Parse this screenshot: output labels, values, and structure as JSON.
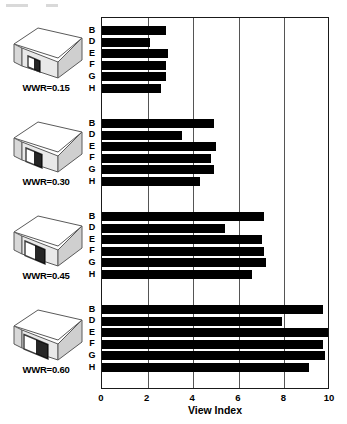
{
  "chart_data": {
    "type": "bar",
    "orientation": "horizontal",
    "title": "",
    "xlabel": "View Index",
    "ylabel": "",
    "xlim": [
      0,
      10
    ],
    "xticks": [
      0,
      2,
      4,
      6,
      8,
      10
    ],
    "xtick_labels": [
      "0",
      "2",
      "4",
      "6",
      "8",
      "10"
    ],
    "grid": "vertical gridlines at each x tick",
    "legend": "none",
    "categories": [
      "B",
      "D",
      "E",
      "F",
      "G",
      "H"
    ],
    "groups": [
      {
        "name": "WWR=0.15",
        "label": "WWR=0.15",
        "values": [
          2.8,
          2.1,
          2.9,
          2.8,
          2.8,
          2.6
        ]
      },
      {
        "name": "WWR=0.30",
        "label": "WWR=0.30",
        "values": [
          4.9,
          3.5,
          5.0,
          4.8,
          4.9,
          4.3
        ]
      },
      {
        "name": "WWR=0.45",
        "label": "WWR=0.45",
        "values": [
          7.1,
          5.4,
          7.0,
          7.1,
          7.2,
          6.6
        ]
      },
      {
        "name": "WWR=0.60",
        "label": "WWR=0.60",
        "values": [
          9.7,
          7.9,
          9.9,
          9.7,
          9.8,
          9.1
        ]
      }
    ]
  },
  "thumbnails": [
    {
      "group": "WWR=0.15",
      "caption": "WWR=0.15",
      "alt": "isometric open-top room box with small square window on left wall",
      "window_w": 13,
      "window_h": 11
    },
    {
      "group": "WWR=0.30",
      "caption": "WWR=0.30",
      "alt": "isometric open-top room box with medium square window on left wall",
      "window_w": 17,
      "window_h": 14
    },
    {
      "group": "WWR=0.45",
      "caption": "WWR=0.45",
      "alt": "isometric open-top room box with large window on left wall",
      "window_w": 21,
      "window_h": 17
    },
    {
      "group": "WWR=0.60",
      "caption": "WWR=0.60",
      "alt": "isometric open-top room box with very large window on left wall",
      "window_w": 25,
      "window_h": 21
    }
  ],
  "colors": {
    "bar": "#000000",
    "gridline": "#555555",
    "frame": "#1a1a1a",
    "background": "#ffffff",
    "wall_light": "#e8e8e8",
    "wall_mid": "#d2d2d2",
    "wall_dark": "#bdbdbd",
    "outline": "#4d4d4d"
  }
}
